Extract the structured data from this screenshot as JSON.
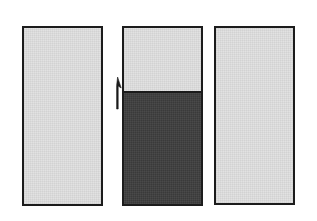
{
  "figure": {
    "name": "three-panel-fill-level-diagram",
    "canvas": {
      "width": 317,
      "height": 221,
      "background": "#ffffff"
    },
    "colors": {
      "outline": "#1c1c1c",
      "empty_fill": "#e2e2e2",
      "dark_fill": "#3a3a3a",
      "background": "#ffffff"
    },
    "panels": [
      {
        "id": "panel-left",
        "label": "",
        "x": 22,
        "y": 26,
        "width": 81,
        "height": 180,
        "fill": "#e2e2e2",
        "fill_level_percent": 0
      },
      {
        "id": "panel-middle",
        "label": "",
        "x": 122,
        "y": 26,
        "width": 81,
        "height": 180,
        "fill": "#e2e2e2",
        "dark_fill": "#3a3a3a",
        "fill_level_percent": 64
      },
      {
        "id": "panel-right",
        "label": "",
        "x": 214,
        "y": 26,
        "width": 81,
        "height": 179,
        "fill": "#e2e2e2",
        "fill_level_percent": 0
      }
    ],
    "annotations": [
      {
        "id": "level-arrow",
        "type": "arrow",
        "direction": "up",
        "label": "",
        "x": 112,
        "y": 76,
        "length": 30
      }
    ]
  }
}
